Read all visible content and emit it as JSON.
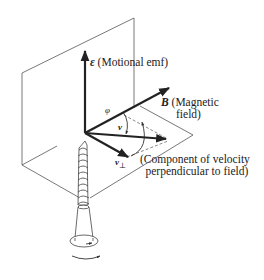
{
  "diagram": {
    "type": "physics-vector-diagram",
    "labels": {
      "emf_symbol": "ε",
      "emf_text": "(Motional emf)",
      "b_symbol": "B",
      "b_text_line1": "(Magnetic",
      "b_text_line2": "field)",
      "phi": "φ",
      "v": "v",
      "v_perp": "v",
      "perp_symbol": "⊥",
      "component_line1": "(Component of velocity",
      "component_line2": "perpendicular to field)"
    },
    "colors": {
      "line": "#333333",
      "thin_line": "#555555",
      "text": "#222222",
      "background": "#ffffff"
    },
    "elements": [
      "vertical-plane",
      "horizontal-plane",
      "emf-vector",
      "magnetic-field-vector",
      "velocity-vector",
      "perpendicular-velocity-vector",
      "angle-arc-phi",
      "rotation-arc",
      "screw",
      "screw-rotation-arrow"
    ]
  }
}
